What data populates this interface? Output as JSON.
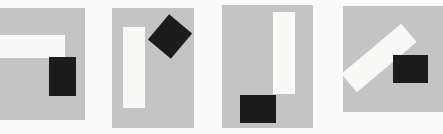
{
  "figure": {
    "panels": [
      {
        "id": 1,
        "description": "horizontal white bar with black rectangle below right end"
      },
      {
        "id": 2,
        "description": "vertical white bar with rotated black square at upper right"
      },
      {
        "id": 3,
        "description": "vertical white bar with black rectangle at bottom left"
      },
      {
        "id": 4,
        "description": "diagonal white bar with black rectangle at right"
      }
    ],
    "colors": {
      "background": "#fafafa",
      "panel": "#c4c4c4",
      "white_bar": "#f8f8f6",
      "black_block": "#1c1c1c"
    }
  }
}
